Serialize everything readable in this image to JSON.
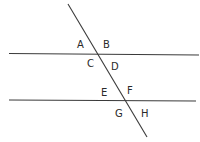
{
  "diagram": {
    "type": "parallel-lines-transversal",
    "background": "#ffffff",
    "line_color": "#3a3a3a",
    "lines": {
      "upper_parallel": {
        "x1": 9,
        "y1": 53.5,
        "x2": 199,
        "y2": 55
      },
      "lower_parallel": {
        "x1": 9,
        "y1": 100,
        "x2": 196,
        "y2": 101
      },
      "transversal": {
        "x1": 68,
        "y1": 4,
        "x2": 147,
        "y2": 137
      }
    },
    "labels": {
      "A": {
        "text": "A",
        "x": 77,
        "y": 48
      },
      "B": {
        "text": "B",
        "x": 103,
        "y": 48
      },
      "C": {
        "text": "C",
        "x": 87,
        "y": 67
      },
      "D": {
        "text": "D",
        "x": 111,
        "y": 70
      },
      "E": {
        "text": "E",
        "x": 101,
        "y": 96
      },
      "F": {
        "text": "F",
        "x": 127,
        "y": 94
      },
      "G": {
        "text": "G",
        "x": 115,
        "y": 117
      },
      "H": {
        "text": "H",
        "x": 141,
        "y": 117
      }
    }
  }
}
